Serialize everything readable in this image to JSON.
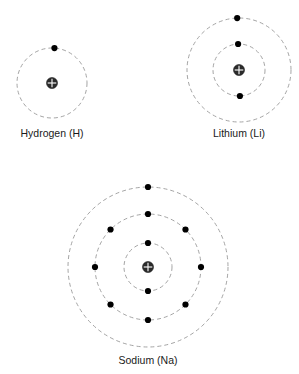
{
  "figure": {
    "background_color": "#ffffff",
    "orbit_color": "#9a9a9a",
    "electron_color": "#000000",
    "nucleus_color": "#2b2b2b",
    "nucleus_symbol": "+",
    "label_color": "#1a1a1a"
  },
  "atoms": [
    {
      "id": "hydrogen",
      "label": "Hydrogen (H)",
      "element_symbol": "H",
      "element_name": "Hydrogen",
      "center": {
        "x": 52,
        "y": 83
      },
      "nucleus_radius": 5.5,
      "label_position": {
        "x": 52,
        "y": 137
      },
      "shells": [
        {
          "index": 1,
          "radius": 35,
          "electron_count": 1,
          "electron_angles": [
            -86
          ]
        }
      ],
      "total_electrons": 1
    },
    {
      "id": "lithium",
      "label": "Lithium (Li)",
      "element_symbol": "Li",
      "element_name": "Lithium",
      "center": {
        "x": 239,
        "y": 70
      },
      "nucleus_radius": 5.5,
      "label_position": {
        "x": 239,
        "y": 137
      },
      "shells": [
        {
          "index": 1,
          "radius": 26,
          "electron_count": 2,
          "electron_angles": [
            -92,
            88
          ]
        },
        {
          "index": 2,
          "radius": 52,
          "electron_count": 1,
          "electron_angles": [
            -92
          ]
        }
      ],
      "total_electrons": 3
    },
    {
      "id": "sodium",
      "label": "Sodium (Na)",
      "element_symbol": "Na",
      "element_name": "Sodium",
      "center": {
        "x": 148,
        "y": 267
      },
      "nucleus_radius": 5.5,
      "label_position": {
        "x": 148,
        "y": 364
      },
      "shells": [
        {
          "index": 1,
          "radius": 24,
          "electron_count": 2,
          "electron_angles": [
            -90,
            90
          ]
        },
        {
          "index": 2,
          "radius": 53,
          "electron_count": 8,
          "electron_angles": [
            -90,
            -45,
            0,
            45,
            90,
            135,
            180,
            -135
          ]
        },
        {
          "index": 3,
          "radius": 80,
          "electron_count": 1,
          "electron_angles": [
            -90
          ]
        }
      ],
      "total_electrons": 11
    }
  ],
  "electron_dot_radius": 3.1
}
